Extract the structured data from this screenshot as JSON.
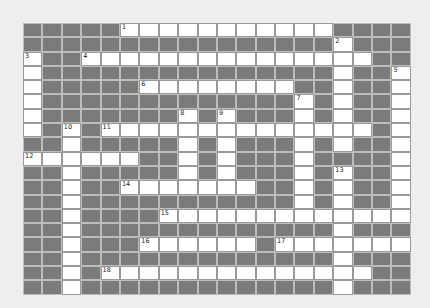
{
  "puzzle": {
    "rows": 19,
    "cols": 20,
    "colors": {
      "background": "#eeeeee",
      "block": "#7b7b7b",
      "open": "#ffffff",
      "gridline": "#bdbdbd"
    },
    "layout": [
      "#####11111111111####",
      "################1###",
      "1##111111111111111##",
      "1###############1##1",
      "1#####11111111##1##1",
      "1#############1#1##1",
      "1#######1#1###1#1##1",
      "1#1#11111111111111#1",
      "##1#####1#1###1#1##1",
      "111111##1#1###1####1",
      "##1#####1#1###1#1##1",
      "##1##1111111##1#1##1",
      "##1###########1#1##1",
      "##1####1111111111111",
      "##1#############1###",
      "##1###111111#1111111",
      "##1#############1###",
      "##1#11111111111111##",
      "##1#############1###"
    ],
    "numbers": [
      {
        "n": "1",
        "r": 0,
        "c": 5
      },
      {
        "n": "2",
        "r": 1,
        "c": 16
      },
      {
        "n": "3",
        "r": 2,
        "c": 0
      },
      {
        "n": "4",
        "r": 2,
        "c": 3
      },
      {
        "n": "5",
        "r": 3,
        "c": 19
      },
      {
        "n": "6",
        "r": 4,
        "c": 6
      },
      {
        "n": "7",
        "r": 5,
        "c": 14
      },
      {
        "n": "8",
        "r": 6,
        "c": 8
      },
      {
        "n": "9",
        "r": 6,
        "c": 10
      },
      {
        "n": "10",
        "r": 7,
        "c": 2
      },
      {
        "n": "11",
        "r": 7,
        "c": 4
      },
      {
        "n": "12",
        "r": 9,
        "c": 0
      },
      {
        "n": "13",
        "r": 10,
        "c": 16
      },
      {
        "n": "14",
        "r": 11,
        "c": 5
      },
      {
        "n": "15",
        "r": 13,
        "c": 7
      },
      {
        "n": "16",
        "r": 15,
        "c": 6
      },
      {
        "n": "17",
        "r": 15,
        "c": 13
      },
      {
        "n": "18",
        "r": 17,
        "c": 4
      }
    ]
  }
}
